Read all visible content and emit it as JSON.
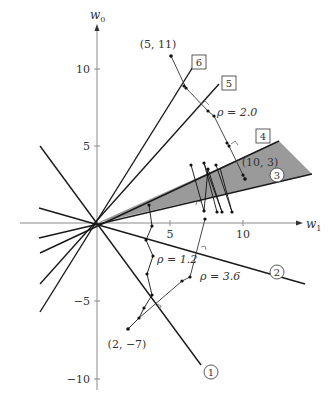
{
  "axes": {
    "x_label": "w",
    "x_sub": "1",
    "y_label": "w",
    "y_sub": "0",
    "x_ticks": [
      {
        "v": 5,
        "label": "5"
      },
      {
        "v": 10,
        "label": "10"
      }
    ],
    "y_ticks": [
      {
        "v": 10,
        "label": "10"
      },
      {
        "v": 5,
        "label": "5"
      },
      {
        "v": -5,
        "label": "−5"
      },
      {
        "v": -10,
        "label": "−10"
      }
    ]
  },
  "rays": [
    {
      "id": "1",
      "label": "1",
      "shape": "circle",
      "end": [
        10.3,
        -10.3
      ]
    },
    {
      "id": "2",
      "label": "2",
      "shape": "circle",
      "end": [
        15.3,
        -3.9
      ]
    },
    {
      "id": "3",
      "label": "3",
      "shape": "circle",
      "end": [
        14.7,
        3.0
      ]
    },
    {
      "id": "4",
      "label": "4",
      "shape": "box",
      "end": [
        12.5,
        5.3
      ]
    },
    {
      "id": "5",
      "label": "5",
      "shape": "box",
      "end": [
        9.0,
        8.3
      ]
    },
    {
      "id": "6",
      "label": "6",
      "shape": "box",
      "end": [
        6.6,
        9.8
      ]
    }
  ],
  "annotations": {
    "start_top": "(5, 11)",
    "start_bottom": "(2, −7)",
    "target": "(10, 3)",
    "rho_top": "ρ = 2.0",
    "rho_mid": "ρ = 1.2",
    "rho_low": "ρ = 3.6"
  },
  "colors": {
    "wedge": "#9a9a9a",
    "line": "#1a1a1a",
    "axis": "#888888"
  }
}
